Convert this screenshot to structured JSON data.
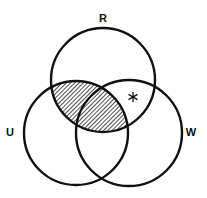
{
  "diagram": {
    "type": "venn",
    "sets": [
      {
        "id": "R",
        "label": "R",
        "cx": 103,
        "cy": 80,
        "r": 52
      },
      {
        "id": "U",
        "label": "U",
        "cx": 76,
        "cy": 133,
        "r": 52
      },
      {
        "id": "W",
        "label": "W",
        "cx": 129,
        "cy": 133,
        "r": 53
      }
    ],
    "shaded_region": "R ∩ U",
    "marker": {
      "symbol": "*",
      "region": "R ∩ W only"
    },
    "colors": {
      "stroke": "#111111",
      "hatch": "#222222",
      "background": "#ffffff"
    }
  }
}
